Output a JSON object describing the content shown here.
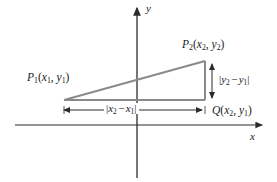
{
  "figure": {
    "background_color": "#ffffff",
    "axis_color": "#2b2b2b",
    "triangle_color": "#8a8a8a",
    "text_color": "#1a1a1a"
  },
  "axes": {
    "x_label": "x",
    "y_label": "y",
    "origin_px": {
      "x": 137,
      "y": 125
    },
    "x_axis_start_px": 15,
    "x_axis_end_px": 265,
    "y_axis_top_px": 5,
    "y_axis_bottom_px": 178
  },
  "points": {
    "p1": {
      "name": "P",
      "index": "1",
      "coord_x": "x",
      "coord_x_index": "1",
      "coord_y": "y",
      "coord_y_index": "1",
      "px": {
        "x": 64,
        "y": 100
      }
    },
    "p2": {
      "name": "P",
      "index": "2",
      "coord_x": "x",
      "coord_x_index": "2",
      "coord_y": "y",
      "coord_y_index": "2",
      "px": {
        "x": 205,
        "y": 61
      }
    },
    "q": {
      "name": "Q",
      "coord_x": "x",
      "coord_x_index": "2",
      "coord_y": "y",
      "coord_y_index": "1",
      "px": {
        "x": 205,
        "y": 100
      }
    }
  },
  "measures": {
    "horizontal": {
      "var_a": "x",
      "var_a_index": "2",
      "var_b": "x",
      "var_b_index": "1",
      "arrow_y_px": 110,
      "arrow_from_px": 61,
      "arrow_to_px": 205
    },
    "vertical": {
      "var_a": "y",
      "var_a_index": "2",
      "var_b": "y",
      "var_b_index": "1",
      "arrow_x_px": 212,
      "arrow_from_px": 61,
      "arrow_to_px": 101
    }
  }
}
